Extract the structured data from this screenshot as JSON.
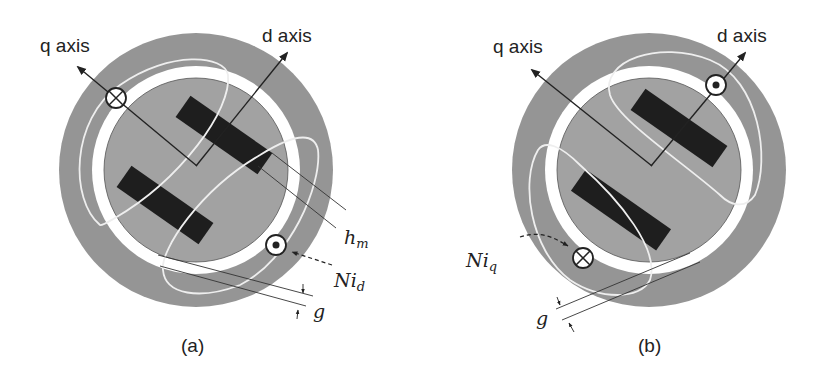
{
  "figure": {
    "colors": {
      "background": "#ffffff",
      "stator": "#959595",
      "rotor": "#a2a2a2",
      "air_gap": "#ffffff",
      "magnet": "#1e1e1e",
      "flux_line": "#eeeeee",
      "stroke": "#222222"
    },
    "panels": [
      {
        "id": "a",
        "caption": "(a)",
        "q_axis_label": "q axis",
        "d_axis_label": "d axis",
        "dimension_label_hm": "h",
        "dimension_label_hm_sub": "m",
        "current_label": "Ni",
        "current_label_sub": "d",
        "gap_label": "g",
        "conductor_into_page": "cross-conductor-icon",
        "conductor_out_of_page": "dot-conductor-icon"
      },
      {
        "id": "b",
        "caption": "(b)",
        "q_axis_label": "q axis",
        "d_axis_label": "d axis",
        "current_label": "Ni",
        "current_label_sub": "q",
        "gap_label": "g",
        "conductor_into_page": "cross-conductor-icon",
        "conductor_out_of_page": "dot-conductor-icon"
      }
    ]
  }
}
